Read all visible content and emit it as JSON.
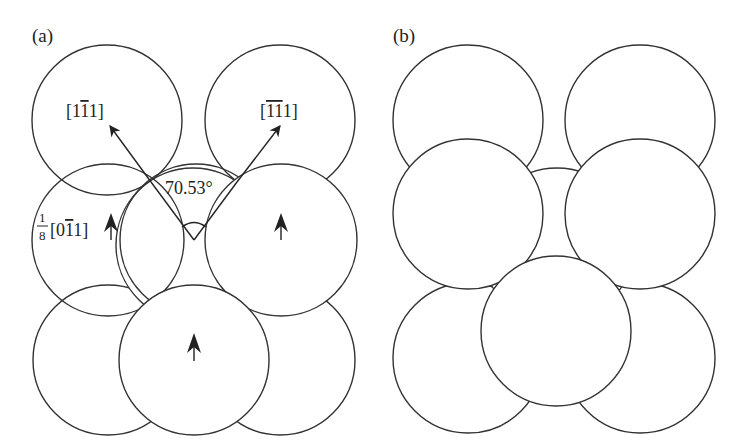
{
  "figure": {
    "panel_a": {
      "label": "(a)",
      "vectors": [
        {
          "label": "[1̄1̄ 1]",
          "text_main": "[1",
          "text_bar": "1",
          "text_end": "1]"
        },
        {
          "label": "[̄1̄1 1]",
          "text_main": "[",
          "text_bar": "11",
          "text_end": "1]"
        }
      ],
      "angle_label": "70.53°",
      "partial_vector": {
        "fraction_num": "1",
        "fraction_den": "8",
        "text_main": "[0",
        "text_bar": "1",
        "text_end": "1]"
      }
    },
    "panel_b": {
      "label": "(b)"
    },
    "colors": {
      "stroke": "#333333",
      "fill": "#ffffff",
      "text": "#222222"
    }
  }
}
